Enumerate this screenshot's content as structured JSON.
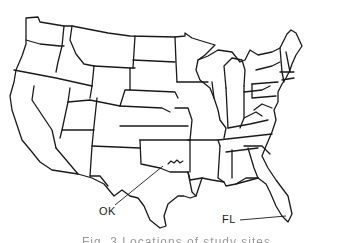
{
  "map": {
    "title": "United States state outline map",
    "stroke_color": "#1a1a1a",
    "background_color": "#ffffff",
    "labels": [
      {
        "id": "ok",
        "text": "OK",
        "points_to": "Oklahoma"
      },
      {
        "id": "fl",
        "text": "FL",
        "points_to": "Florida"
      }
    ]
  },
  "caption": {
    "text": "Fig. 3  Locations of study sites",
    "note": "cropped, partially visible"
  }
}
